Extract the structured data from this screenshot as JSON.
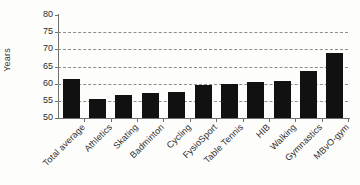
{
  "chart_data": {
    "type": "bar",
    "title": "",
    "xlabel": "",
    "ylabel": "Years",
    "ylim": [
      50,
      80
    ],
    "ytick_step": 5,
    "yticks": [
      50,
      55,
      60,
      65,
      70,
      75,
      80
    ],
    "grid": true,
    "grid_style": "dashed horizontal",
    "legend": "none",
    "bar_color": "#111111",
    "categories": [
      "Total average",
      "Athletics",
      "Skating",
      "Badminton",
      "Cycling",
      "FysioSport",
      "Table Tennis",
      "HIB",
      "Walking",
      "Gymnastics",
      "MBvO-gym"
    ],
    "values": [
      61.5,
      55.5,
      56.6,
      57.4,
      57.5,
      59.7,
      59.8,
      60.6,
      60.7,
      63.7,
      68.8
    ]
  },
  "axis": {
    "y_title": "Years",
    "tick_labels": [
      "80",
      "75",
      "70",
      "65",
      "60",
      "55",
      "50"
    ]
  }
}
